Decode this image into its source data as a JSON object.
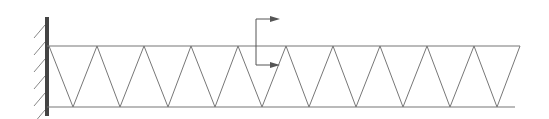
{
  "diagram": {
    "type": "cantilever-truss",
    "colors": {
      "wall": "#444444",
      "member": "#777777",
      "hatch": "#888888",
      "arrow": "#555555"
    },
    "wall": {
      "x": 47,
      "y1": 17,
      "y2": 116,
      "hatch_ys": [
        28,
        45,
        62,
        79,
        96,
        113
      ]
    },
    "top_chord": {
      "y": 46,
      "x1": 47,
      "x2": 520
    },
    "bottom_chord": {
      "y": 107,
      "x1": 47,
      "x2": 515
    },
    "top_nodes_x": [
      49,
      97,
      144,
      191,
      238,
      286,
      333,
      380,
      427,
      474,
      520
    ],
    "bottom_nodes_x": [
      73,
      120,
      168,
      215,
      262,
      309,
      356,
      403,
      450,
      497
    ],
    "section_cut": {
      "x": 256,
      "y_top": 19,
      "y_bottom": 65,
      "arrow_len": 24
    }
  }
}
